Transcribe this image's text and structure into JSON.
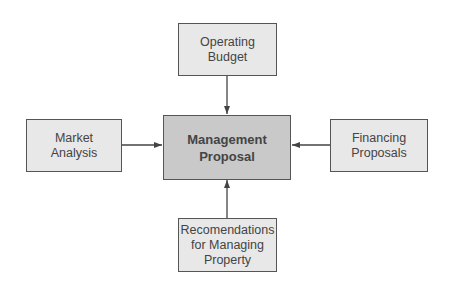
{
  "diagram": {
    "center": {
      "lines": [
        "Management",
        "Proposal"
      ]
    },
    "top": {
      "lines": [
        "Operating",
        "Budget"
      ]
    },
    "left": {
      "lines": [
        "Market",
        "Analysis"
      ]
    },
    "right": {
      "lines": [
        "Financing",
        "Proposals"
      ]
    },
    "bottom": {
      "lines": [
        "Recomendations",
        "for Managing",
        "Property"
      ]
    },
    "colors": {
      "center_fill": "#c9c9c9",
      "node_fill": "#e8e8e8",
      "border": "#555555",
      "arrow": "#444444"
    }
  }
}
